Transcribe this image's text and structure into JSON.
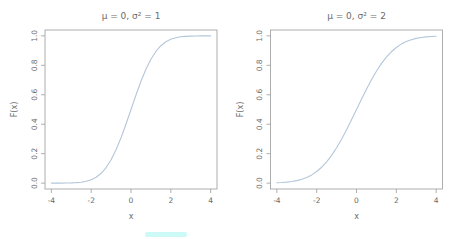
{
  "figure": {
    "background": "#ffffff",
    "colors": {
      "curve": "#b4c7da",
      "axis": "#9a9a9a",
      "text": "#6b6b6b",
      "artifact": "#cdf9f6"
    },
    "artifact": {
      "x": 145,
      "y": 232,
      "width": 42,
      "height": 5
    }
  },
  "chart_data": [
    {
      "type": "line",
      "title": "μ = 0,  σ² = 1",
      "xlabel": "x",
      "ylabel": "F(x)",
      "xlim": [
        -4,
        4
      ],
      "ylim": [
        0,
        1
      ],
      "xticks": [
        "-4",
        "-2",
        "0",
        "2",
        "4"
      ],
      "yticks": [
        "0.0",
        "0.2",
        "0.4",
        "0.6",
        "0.8",
        "1.0"
      ],
      "grid": false,
      "legend": "none",
      "box": true,
      "series": [
        {
          "name": "Normal CDF (mu=0, var=1)",
          "x": [
            -4,
            -3.75,
            -3.5,
            -3.25,
            -3,
            -2.75,
            -2.5,
            -2.25,
            -2,
            -1.75,
            -1.5,
            -1.25,
            -1,
            -0.75,
            -0.5,
            -0.25,
            0,
            0.25,
            0.5,
            0.75,
            1,
            1.25,
            1.5,
            1.75,
            2,
            2.25,
            2.5,
            2.75,
            3,
            3.25,
            3.5,
            3.75,
            4
          ],
          "y": [
            0.0,
            0.0001,
            0.0002,
            0.0006,
            0.0013,
            0.003,
            0.0062,
            0.0122,
            0.0228,
            0.0401,
            0.0668,
            0.1056,
            0.1587,
            0.2266,
            0.3085,
            0.4013,
            0.5,
            0.5987,
            0.6915,
            0.7734,
            0.8413,
            0.8944,
            0.9332,
            0.9599,
            0.9772,
            0.9878,
            0.9938,
            0.997,
            0.9987,
            0.9994,
            0.9998,
            0.9999,
            1.0
          ]
        }
      ]
    },
    {
      "type": "line",
      "title": "μ = 0,  σ² = 2",
      "xlabel": "x",
      "ylabel": "F(x)",
      "xlim": [
        -4,
        4
      ],
      "ylim": [
        0,
        1
      ],
      "xticks": [
        "-4",
        "-2",
        "0",
        "2",
        "4"
      ],
      "yticks": [
        "0.0",
        "0.2",
        "0.4",
        "0.6",
        "0.8",
        "1.0"
      ],
      "grid": false,
      "legend": "none",
      "box": true,
      "series": [
        {
          "name": "Normal CDF (mu=0, var=2)",
          "x": [
            -4,
            -3.75,
            -3.5,
            -3.25,
            -3,
            -2.75,
            -2.5,
            -2.25,
            -2,
            -1.75,
            -1.5,
            -1.25,
            -1,
            -0.75,
            -0.5,
            -0.25,
            0,
            0.25,
            0.5,
            0.75,
            1,
            1.25,
            1.5,
            1.75,
            2,
            2.25,
            2.5,
            2.75,
            3,
            3.25,
            3.5,
            3.75,
            4
          ],
          "y": [
            0.0023,
            0.004,
            0.0067,
            0.0108,
            0.017,
            0.0259,
            0.0386,
            0.0558,
            0.0787,
            0.108,
            0.1444,
            0.1883,
            0.2398,
            0.2979,
            0.3617,
            0.4298,
            0.5,
            0.5702,
            0.6383,
            0.7021,
            0.7602,
            0.8117,
            0.8556,
            0.892,
            0.9213,
            0.9442,
            0.9614,
            0.9741,
            0.983,
            0.9892,
            0.9933,
            0.996,
            0.9977
          ]
        }
      ]
    }
  ]
}
